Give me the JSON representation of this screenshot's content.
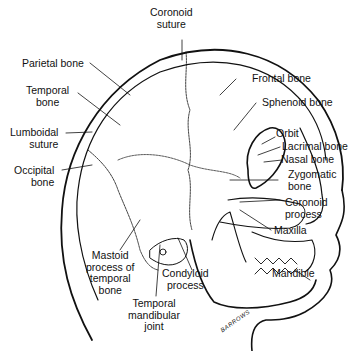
{
  "diagram": {
    "labels": {
      "coronoid_suture_1": "Coronoid",
      "coronoid_suture_2": "suture",
      "parietal_bone": "Parietal bone",
      "temporal_bone_1": "Temporal",
      "temporal_bone_2": "bone",
      "lumboidal_suture_1": "Lumboidal",
      "lumboidal_suture_2": "suture",
      "occipital_bone_1": "Occipital",
      "occipital_bone_2": "bone",
      "frontal_bone": "Frontal bone",
      "sphenoid_bone": "Sphenoid bone",
      "orbit": "Orbit",
      "lacrimal_bone": "Lacrimal bone",
      "nasal_bone": "Nasal bone",
      "zygomatic_bone_1": "Zygomatic",
      "zygomatic_bone_2": "bone",
      "coronoid_process_1": "Coronoid",
      "coronoid_process_2": "process",
      "maxilla": "Maxilla",
      "mandible": "Mandible",
      "mastoid_1": "Mastoid",
      "mastoid_2": "process of",
      "mastoid_3": "temporal",
      "mastoid_4": "bone",
      "condyloid_1": "Condyloid",
      "condyloid_2": "process",
      "tmj_1": "Temporal",
      "tmj_2": "mandibular",
      "tmj_3": "joint"
    },
    "signature": "BARROWS"
  }
}
